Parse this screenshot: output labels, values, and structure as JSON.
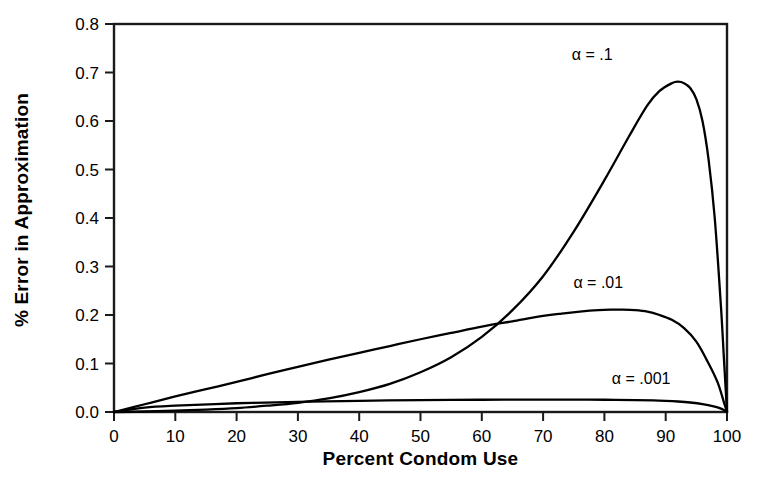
{
  "chart_data": {
    "type": "line",
    "title": "",
    "xlabel": "Percent Condom Use",
    "ylabel": "% Error in Approximation",
    "xlim": [
      0,
      100
    ],
    "ylim": [
      0.0,
      0.8
    ],
    "xticks": [
      "0",
      "10",
      "20",
      "30",
      "40",
      "50",
      "60",
      "70",
      "80",
      "90",
      "100"
    ],
    "yticks": [
      "0.0",
      "0.1",
      "0.2",
      "0.3",
      "0.4",
      "0.5",
      "0.6",
      "0.7",
      "0.8"
    ],
    "grid": false,
    "legend_position": "inline-annotations",
    "series": [
      {
        "name": "α = .1",
        "label": "α = .1",
        "color": "#000000",
        "annotation": {
          "x": 78,
          "y": 0.725
        },
        "x": [
          0,
          5,
          10,
          15,
          20,
          25,
          30,
          35,
          40,
          45,
          50,
          55,
          60,
          65,
          70,
          75,
          80,
          84,
          87,
          89,
          91,
          92,
          93,
          94,
          95,
          96,
          97,
          98,
          99,
          99.5,
          100
        ],
        "y": [
          0.0,
          0.001,
          0.003,
          0.005,
          0.008,
          0.013,
          0.019,
          0.028,
          0.041,
          0.058,
          0.082,
          0.113,
          0.155,
          0.21,
          0.28,
          0.372,
          0.478,
          0.568,
          0.632,
          0.662,
          0.678,
          0.681,
          0.678,
          0.668,
          0.645,
          0.6,
          0.52,
          0.4,
          0.22,
          0.11,
          0.0
        ]
      },
      {
        "name": "α = .01",
        "label": "α = .01",
        "color": "#000000",
        "annotation": {
          "x": 79,
          "y": 0.255
        },
        "x": [
          0,
          5,
          10,
          15,
          20,
          25,
          30,
          35,
          40,
          45,
          50,
          55,
          60,
          65,
          70,
          73,
          76,
          79,
          81,
          83,
          85,
          87,
          89,
          91,
          93,
          95,
          97,
          98.5,
          99.5,
          100
        ],
        "y": [
          0.0,
          0.016,
          0.032,
          0.047,
          0.062,
          0.078,
          0.093,
          0.108,
          0.122,
          0.136,
          0.15,
          0.163,
          0.176,
          0.187,
          0.198,
          0.203,
          0.207,
          0.21,
          0.211,
          0.211,
          0.21,
          0.207,
          0.2,
          0.19,
          0.173,
          0.145,
          0.1,
          0.06,
          0.02,
          0.0
        ]
      },
      {
        "name": "α = .001",
        "label": "α = .001",
        "color": "#000000",
        "annotation": {
          "x": 86,
          "y": 0.058
        },
        "x": [
          0,
          5,
          10,
          20,
          30,
          40,
          50,
          60,
          70,
          75,
          80,
          85,
          88,
          90,
          92,
          94,
          96,
          98,
          99,
          99.5,
          100
        ],
        "y": [
          0.0,
          0.009,
          0.013,
          0.018,
          0.021,
          0.023,
          0.0245,
          0.0253,
          0.0256,
          0.0256,
          0.0253,
          0.0246,
          0.0238,
          0.0229,
          0.0216,
          0.0196,
          0.0164,
          0.011,
          0.007,
          0.004,
          0.0
        ]
      }
    ]
  },
  "axes": {
    "x_title": "Percent Condom Use",
    "y_title": "% Error in Approximation"
  }
}
